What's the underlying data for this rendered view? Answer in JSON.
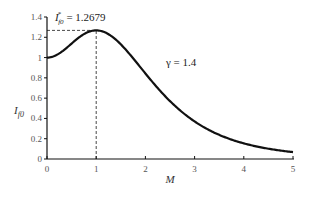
{
  "chart_data": {
    "type": "line",
    "title": "",
    "xlabel": "M",
    "ylabel": "I_f0",
    "xlim": [
      0,
      5
    ],
    "ylim": [
      0,
      1.4
    ],
    "xticks": [
      0,
      1,
      2,
      3,
      4,
      5
    ],
    "yticks": [
      0,
      0.2,
      0.4,
      0.6,
      0.8,
      1,
      1.2,
      1.4
    ],
    "xtick_labels": [
      "0",
      "1",
      "2",
      "3",
      "4",
      "5"
    ],
    "ytick_labels": [
      "0",
      "0.2",
      "0.4",
      "0.6",
      "0.8",
      "1",
      "1.2",
      "1.4"
    ],
    "grid": false,
    "legend": "none",
    "series": [
      {
        "name": "γ = 1.4",
        "gamma": 1.4,
        "x": [
          0,
          0.25,
          0.5,
          0.75,
          1,
          1.25,
          1.5,
          1.75,
          2,
          2.5,
          3,
          3.5,
          4,
          4.5,
          5
        ],
        "values": [
          1.0,
          1.071,
          1.165,
          1.238,
          1.268,
          1.252,
          1.199,
          1.123,
          1.038,
          0.859,
          0.687,
          0.538,
          0.415,
          0.318,
          0.068
        ]
      }
    ],
    "annotations": [
      {
        "text": "γ = 1.4",
        "x": 2.8,
        "y": 0.95
      },
      {
        "text_main": "I",
        "text_sub": "f0",
        "text_sup": "*",
        "text_value": " = 1.2679",
        "x": 1,
        "y": 1.2679
      }
    ],
    "reference_lines": [
      {
        "type": "dashed-horizontal",
        "y": 1.2679,
        "x_from": 0,
        "x_to": 1
      },
      {
        "type": "dashed-vertical",
        "x": 1,
        "y_from": 0,
        "y_to": 1.2679
      }
    ]
  }
}
